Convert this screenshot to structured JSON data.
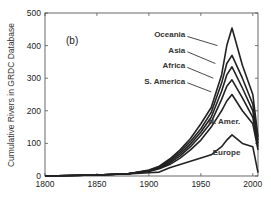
{
  "chart_data": {
    "type": "line",
    "panel_label": "(b)",
    "title": "",
    "xlabel": "",
    "ylabel": "Cumulative Rivers in GRDC Database",
    "xlim": [
      1800,
      2005
    ],
    "ylim": [
      0,
      500
    ],
    "x_ticks": [
      1800,
      1850,
      1900,
      1950,
      2000
    ],
    "y_ticks": [
      0,
      100,
      200,
      300,
      400,
      500
    ],
    "grid": false,
    "stacked": true,
    "x": [
      1800,
      1850,
      1880,
      1900,
      1910,
      1920,
      1930,
      1940,
      1950,
      1960,
      1970,
      1975,
      1980,
      1990,
      2000,
      2005
    ],
    "series": [
      {
        "name": "Europe",
        "values": [
          0,
          3,
          6,
          10,
          12,
          25,
          35,
          45,
          55,
          65,
          90,
          110,
          126,
          100,
          90,
          10
        ]
      },
      {
        "name": "N. Amer.",
        "values": [
          0,
          3,
          7,
          14,
          22,
          35,
          55,
          80,
          110,
          150,
          200,
          230,
          250,
          200,
          160,
          80
        ]
      },
      {
        "name": "S. America",
        "values": [
          0,
          3,
          7,
          15,
          24,
          40,
          62,
          90,
          125,
          165,
          235,
          275,
          295,
          240,
          180,
          90
        ]
      },
      {
        "name": "Africa",
        "values": [
          0,
          3,
          7,
          16,
          26,
          44,
          68,
          98,
          135,
          180,
          260,
          310,
          335,
          270,
          200,
          100
        ]
      },
      {
        "name": "Asia",
        "values": [
          0,
          3,
          7,
          17,
          28,
          48,
          74,
          106,
          145,
          195,
          285,
          345,
          370,
          300,
          220,
          110
        ]
      },
      {
        "name": "Oceania",
        "values": [
          0,
          3,
          7,
          18,
          30,
          52,
          80,
          115,
          160,
          210,
          310,
          400,
          454,
          340,
          250,
          120
        ]
      }
    ],
    "annotations": [
      {
        "text": "Oceania",
        "x": 1935,
        "y": 425
      },
      {
        "text": "Asia",
        "x": 1935,
        "y": 378
      },
      {
        "text": "Africa",
        "x": 1935,
        "y": 330
      },
      {
        "text": "S. America",
        "x": 1935,
        "y": 283
      },
      {
        "text": "N. Amer.",
        "x": 1988,
        "y": 160
      },
      {
        "text": "Europe",
        "x": 1988,
        "y": 65
      }
    ]
  }
}
